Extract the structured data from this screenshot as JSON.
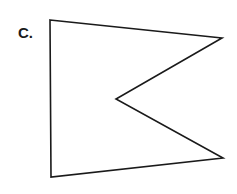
{
  "figure": {
    "label": "C.",
    "shape": "concave-pentagon",
    "stroke_color": "#1a1a1a",
    "fill_color": "#ffffff",
    "vertices": [
      [
        50,
        20
      ],
      [
        222,
        38
      ],
      [
        116,
        99
      ],
      [
        223,
        158
      ],
      [
        51,
        177
      ]
    ]
  }
}
